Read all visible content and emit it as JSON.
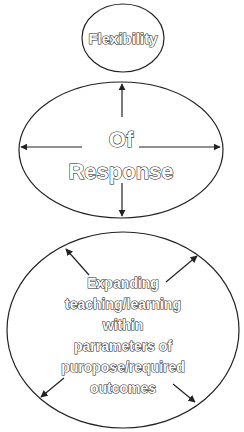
{
  "diagram": {
    "top_circle": {
      "label": "Flexibility"
    },
    "middle_circle": {
      "line1": "Of",
      "line2": "Response",
      "arrows": [
        "up",
        "left",
        "right",
        "down"
      ]
    },
    "bottom_circle": {
      "lines": [
        "Expanding",
        "teaching/learning",
        "within",
        "parrameters of",
        "puropose/required",
        "outcomes"
      ],
      "arrows": [
        "up-left",
        "up-right",
        "down-left",
        "down-right"
      ]
    },
    "colors": {
      "stroke": "#222222",
      "background": "#ffffff",
      "text_fill": "#ffffff"
    }
  }
}
